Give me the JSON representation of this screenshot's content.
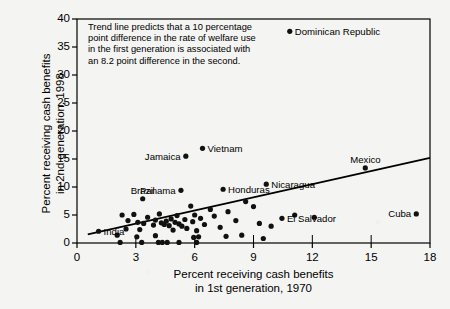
{
  "chart_data": {
    "type": "scatter",
    "title": "",
    "xlabel": "Percent receiving cash benefits\nin 1st generation, 1970",
    "ylabel": "Percent receiving cash benefits\nin 2nd generation, 1998",
    "xlim": [
      0,
      18
    ],
    "ylim": [
      0,
      40
    ],
    "xticks": [
      0,
      3,
      6,
      9,
      12,
      15,
      18
    ],
    "yticks": [
      0,
      5,
      10,
      15,
      20,
      25,
      30,
      35,
      40
    ],
    "grid": false,
    "legend": null,
    "annotation": "Trend line predicts that a 10 percentage\npoint difference in the rate of welfare use\nin the first generation is associated with\nan 8.2 point difference in the second.",
    "trendline": {
      "type": "linear",
      "slope": 0.82,
      "x_start": 0.55,
      "y_start": 1.55,
      "x_end": 18.0,
      "y_end": 15.2
    },
    "labeled_points": [
      {
        "label": "Dominican Republic",
        "x": 10.85,
        "y": 37.8,
        "label_pos": "right"
      },
      {
        "label": "Vietnam",
        "x": 6.4,
        "y": 16.9,
        "label_pos": "right"
      },
      {
        "label": "Jamaica",
        "x": 5.55,
        "y": 15.5,
        "label_pos": "left"
      },
      {
        "label": "Mexico",
        "x": 14.7,
        "y": 13.4,
        "label_pos": "above"
      },
      {
        "label": "Nicaragua",
        "x": 9.65,
        "y": 10.5,
        "label_pos": "right"
      },
      {
        "label": "Honduras",
        "x": 7.45,
        "y": 9.6,
        "label_pos": "right"
      },
      {
        "label": "Panama",
        "x": 5.3,
        "y": 9.4,
        "label_pos": "left"
      },
      {
        "label": "Brazil",
        "x": 3.35,
        "y": 7.9,
        "label_pos": "above"
      },
      {
        "label": "El Salvador",
        "x": 10.45,
        "y": 4.4,
        "label_pos": "right"
      },
      {
        "label": "Cuba",
        "x": 17.3,
        "y": 5.2,
        "label_pos": "left"
      },
      {
        "label": "India",
        "x": 1.1,
        "y": 2.1,
        "label_pos": "right"
      }
    ],
    "unlabeled_points": [
      {
        "x": 2.3,
        "y": 5.0
      },
      {
        "x": 2.9,
        "y": 5.1
      },
      {
        "x": 2.6,
        "y": 4.0
      },
      {
        "x": 3.1,
        "y": 3.7
      },
      {
        "x": 3.4,
        "y": 3.5
      },
      {
        "x": 3.6,
        "y": 4.6
      },
      {
        "x": 3.9,
        "y": 3.2
      },
      {
        "x": 4.0,
        "y": 4.1
      },
      {
        "x": 4.2,
        "y": 5.2
      },
      {
        "x": 4.3,
        "y": 3.6
      },
      {
        "x": 4.45,
        "y": 3.3
      },
      {
        "x": 4.55,
        "y": 3.9
      },
      {
        "x": 4.7,
        "y": 3.1
      },
      {
        "x": 4.8,
        "y": 4.3
      },
      {
        "x": 4.9,
        "y": 2.3
      },
      {
        "x": 5.0,
        "y": 3.7
      },
      {
        "x": 5.1,
        "y": 4.9
      },
      {
        "x": 5.2,
        "y": 3.4
      },
      {
        "x": 5.35,
        "y": 3.0
      },
      {
        "x": 5.5,
        "y": 4.2
      },
      {
        "x": 5.6,
        "y": 2.6
      },
      {
        "x": 5.8,
        "y": 6.6
      },
      {
        "x": 5.9,
        "y": 3.8
      },
      {
        "x": 6.0,
        "y": 5.0
      },
      {
        "x": 6.1,
        "y": 2.2
      },
      {
        "x": 6.3,
        "y": 4.4
      },
      {
        "x": 6.5,
        "y": 3.3
      },
      {
        "x": 6.8,
        "y": 6.0
      },
      {
        "x": 7.0,
        "y": 4.8
      },
      {
        "x": 7.3,
        "y": 2.8
      },
      {
        "x": 7.7,
        "y": 5.6
      },
      {
        "x": 8.1,
        "y": 4.0
      },
      {
        "x": 8.6,
        "y": 7.4
      },
      {
        "x": 9.0,
        "y": 6.5
      },
      {
        "x": 9.3,
        "y": 3.5
      },
      {
        "x": 9.9,
        "y": 3.0
      },
      {
        "x": 11.1,
        "y": 5.0
      },
      {
        "x": 12.1,
        "y": 4.6
      },
      {
        "x": 2.2,
        "y": 0.1
      },
      {
        "x": 3.3,
        "y": 0.1
      },
      {
        "x": 4.15,
        "y": 0.1
      },
      {
        "x": 4.35,
        "y": 0.1
      },
      {
        "x": 4.6,
        "y": 0.1
      },
      {
        "x": 5.2,
        "y": 0.1
      },
      {
        "x": 6.1,
        "y": 0.1
      },
      {
        "x": 3.05,
        "y": 1.1
      },
      {
        "x": 4.0,
        "y": 1.3
      },
      {
        "x": 2.05,
        "y": 1.4
      },
      {
        "x": 2.5,
        "y": 2.5
      },
      {
        "x": 3.2,
        "y": 2.4
      },
      {
        "x": 5.95,
        "y": 1.0
      },
      {
        "x": 6.2,
        "y": 1.1
      },
      {
        "x": 7.6,
        "y": 1.2
      },
      {
        "x": 8.4,
        "y": 1.4
      },
      {
        "x": 9.5,
        "y": 0.8
      }
    ]
  },
  "axes": {
    "x_title": "Percent receiving cash benefits\nin 1st generation, 1970",
    "y_title": "Percent receiving cash benefits\nin 2nd generation, 1998",
    "x_tick_labels": [
      "0",
      "3",
      "6",
      "9",
      "12",
      "15",
      "18"
    ],
    "y_tick_labels": [
      "0",
      "5",
      "10",
      "15",
      "20",
      "25",
      "30",
      "35",
      "40"
    ]
  },
  "annotation_text": "Trend line predicts that a 10 percentage\npoint difference in the rate of welfare use\nin the first generation is associated with\nan 8.2 point difference in the second.",
  "colors": {
    "background": "#f4f4f2",
    "axis": "#000000",
    "point": "#111111",
    "trendline": "#000000",
    "text": "#000000"
  }
}
